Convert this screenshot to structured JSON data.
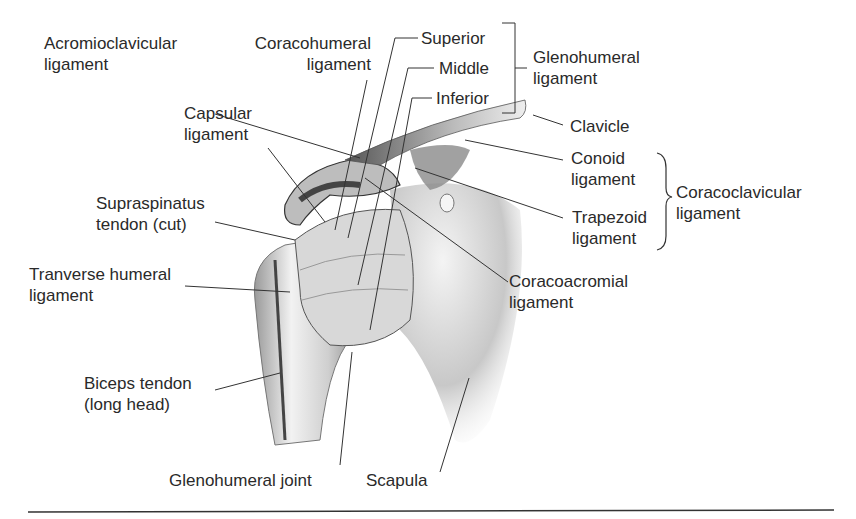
{
  "figure": {
    "labels": {
      "acromioclavicular": {
        "line1": "Acromioclavicular",
        "line2": "ligament"
      },
      "coracohumeral": {
        "line1": "Coracohumeral",
        "line2": "ligament"
      },
      "capsular": {
        "line1": "Capsular",
        "line2": "ligament"
      },
      "supraspinatus": {
        "line1": "Supraspinatus",
        "line2": "tendon (cut)"
      },
      "transverse_humeral": {
        "line1": "Tranverse humeral",
        "line2": "ligament"
      },
      "biceps": {
        "line1": "Biceps tendon",
        "line2": "(long head)"
      },
      "glenohumeral_joint": {
        "line1": "Glenohumeral joint"
      },
      "scapula": {
        "line1": "Scapula"
      },
      "superior": {
        "line1": "Superior"
      },
      "middle": {
        "line1": "Middle"
      },
      "inferior": {
        "line1": "Inferior"
      },
      "glenohumeral_ligament": {
        "line1": "Glenohumeral",
        "line2": "ligament"
      },
      "clavicle": {
        "line1": "Clavicle"
      },
      "conoid": {
        "line1": "Conoid",
        "line2": "ligament"
      },
      "trapezoid": {
        "line1": "Trapezoid",
        "line2": "ligament"
      },
      "coracoclavicular": {
        "line1": "Coracoclavicular",
        "line2": "ligament"
      },
      "coracoacromial": {
        "line1": "Coracoacromial",
        "line2": "ligament"
      }
    }
  }
}
